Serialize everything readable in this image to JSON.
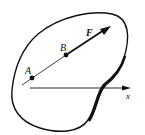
{
  "diagram": {
    "type": "rigid-body force diagram",
    "points": [
      {
        "id": "A",
        "label": "A"
      },
      {
        "id": "B",
        "label": "B"
      }
    ],
    "force": {
      "label": "F"
    },
    "axis": {
      "label": "x"
    },
    "colors": {
      "stroke": "#111111",
      "background": "#ffffff"
    }
  }
}
